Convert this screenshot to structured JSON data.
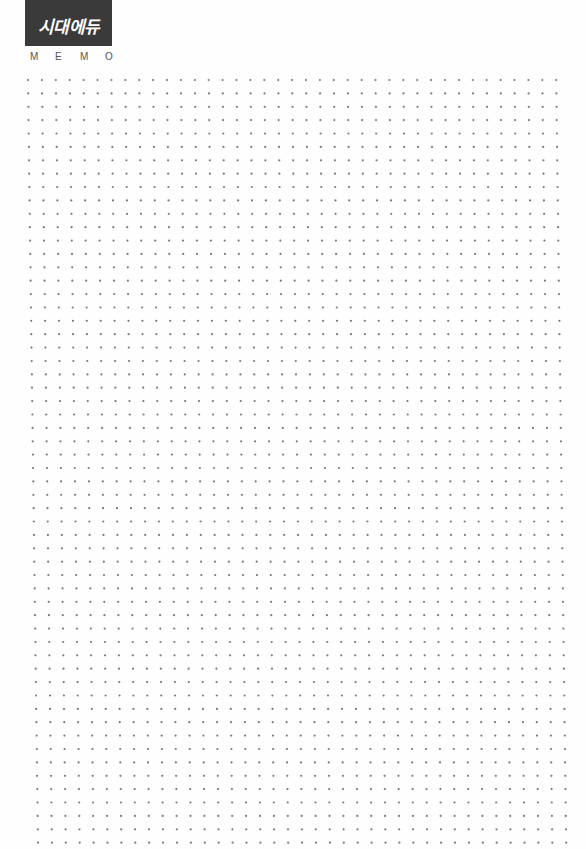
{
  "header": {
    "brand": "시대에듀",
    "section_label_letters": [
      "M",
      "E",
      "M",
      "O"
    ]
  },
  "grid": {
    "columns": 39,
    "rows": 58,
    "start_x": 28,
    "start_y": 80,
    "spacing_x": 13.9,
    "spacing_y": 13.38,
    "drift_x_total": 10,
    "dot_radius": 1.1
  },
  "colors": {
    "logo_background": "#3a3a3a",
    "logo_text": "#ffffff",
    "label_text": "#555555",
    "dot": "#7a7a7a",
    "page_background": "#fefefe"
  }
}
